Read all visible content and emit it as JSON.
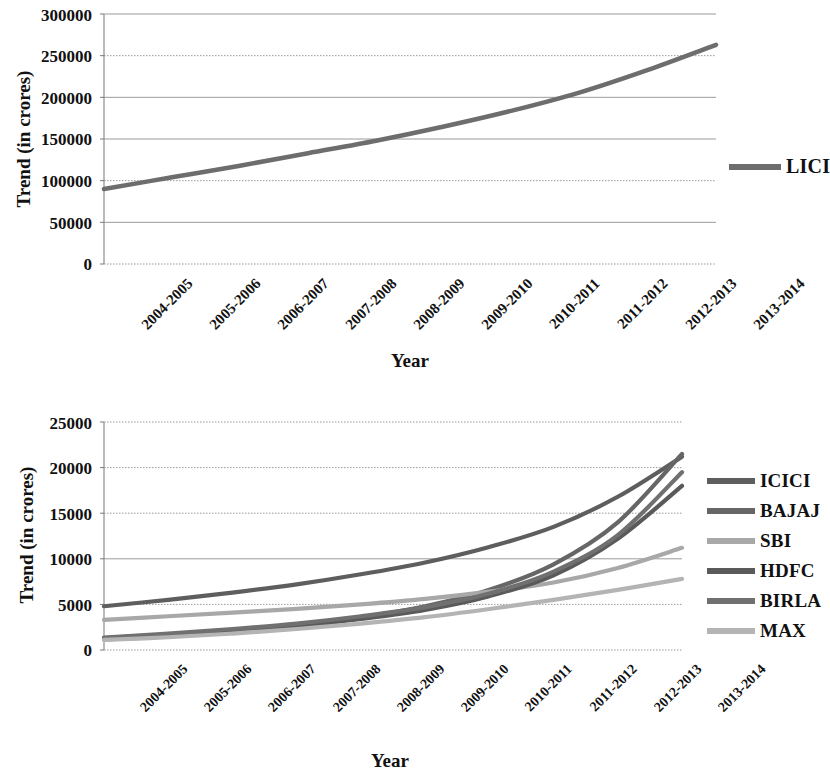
{
  "charts": [
    {
      "id": "lici-trend-chart",
      "ylabel": "Trend (in crores)",
      "xlabel": "Year",
      "yticks": [
        "0",
        "50000",
        "100000",
        "150000",
        "200000",
        "250000",
        "300000"
      ],
      "legend": [
        {
          "label": "LICI",
          "color": "#6d6d6d"
        }
      ]
    },
    {
      "id": "private-insurers-trend-chart",
      "ylabel": "Trend (in crores)",
      "xlabel": "Year",
      "yticks": [
        "0",
        "5000",
        "10000",
        "15000",
        "20000",
        "25000"
      ],
      "legend": [
        {
          "label": "ICICI",
          "color": "#5e5e5e"
        },
        {
          "label": "BAJAJ",
          "color": "#666666"
        },
        {
          "label": "SBI",
          "color": "#a8a8a8"
        },
        {
          "label": "HDFC",
          "color": "#5a5a5a"
        },
        {
          "label": "BIRLA",
          "color": "#707070"
        },
        {
          "label": "MAX",
          "color": "#b4b4b4"
        }
      ]
    }
  ],
  "categories": [
    "2004-2005",
    "2005-2006",
    "2006-2007",
    "2007-2008",
    "2008-2009",
    "2009-2010",
    "2010-2011",
    "2011-2012",
    "2012-2013",
    "2013-2014"
  ],
  "chart_data": [
    {
      "type": "line",
      "title": "",
      "xlabel": "Year",
      "ylabel": "Trend (in crores)",
      "categories": [
        "2004-2005",
        "2005-2006",
        "2006-2007",
        "2007-2008",
        "2008-2009",
        "2009-2010",
        "2010-2011",
        "2011-2012",
        "2012-2013",
        "2013-2014"
      ],
      "ylim": [
        0,
        300000
      ],
      "ytick_step": 50000,
      "grid": true,
      "legend_position": "right",
      "series": [
        {
          "name": "LICI",
          "color": "#6d6d6d",
          "values": [
            90000,
            104000,
            118000,
            133000,
            148000,
            165000,
            184000,
            206000,
            233000,
            263000
          ]
        }
      ]
    },
    {
      "type": "line",
      "title": "",
      "xlabel": "Year",
      "ylabel": "Trend (in crores)",
      "categories": [
        "2004-2005",
        "2005-2006",
        "2006-2007",
        "2007-2008",
        "2008-2009",
        "2009-2010",
        "2010-2011",
        "2011-2012",
        "2012-2013",
        "2013-2014"
      ],
      "ylim": [
        0,
        25000
      ],
      "ytick_step": 5000,
      "grid": true,
      "legend_position": "right",
      "series": [
        {
          "name": "ICICI",
          "color": "#5e5e5e",
          "values": [
            4800,
            5500,
            6300,
            7200,
            8300,
            9600,
            11300,
            13500,
            16800,
            21200
          ]
        },
        {
          "name": "BAJAJ",
          "color": "#666666",
          "values": [
            1300,
            1700,
            2200,
            2800,
            3600,
            4800,
            6600,
            9400,
            14000,
            21500
          ]
        },
        {
          "name": "SBI",
          "color": "#a8a8a8",
          "values": [
            3300,
            3700,
            4100,
            4500,
            5000,
            5600,
            6400,
            7400,
            9000,
            11200
          ]
        },
        {
          "name": "HDFC",
          "color": "#5a5a5a",
          "values": [
            1150,
            1500,
            2000,
            2600,
            3400,
            4400,
            5900,
            8200,
            12200,
            18000
          ]
        },
        {
          "name": "BIRLA",
          "color": "#707070",
          "values": [
            1350,
            1800,
            2300,
            2900,
            3700,
            4700,
            6200,
            8600,
            12600,
            19500
          ]
        },
        {
          "name": "MAX",
          "color": "#b4b4b4",
          "values": [
            1100,
            1400,
            1800,
            2300,
            2900,
            3600,
            4500,
            5500,
            6600,
            7800
          ]
        }
      ]
    }
  ]
}
